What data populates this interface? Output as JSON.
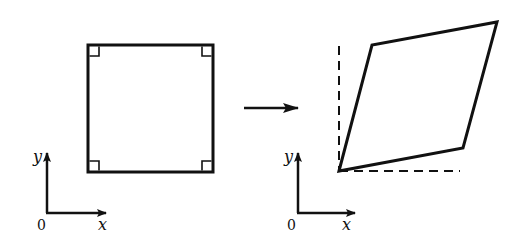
{
  "diagram": {
    "colors": {
      "stroke": "#111111",
      "background": "#ffffff"
    },
    "left_panel": {
      "shape": "square",
      "right_angle_markers": 4,
      "axes": {
        "origin_label": "0",
        "x_label": "x",
        "y_label": "y"
      }
    },
    "transition": {
      "icon": "right-arrow-icon"
    },
    "right_panel": {
      "shape": "parallelogram",
      "reference_lines": "dashed",
      "axes": {
        "origin_label": "0",
        "x_label": "x",
        "y_label": "y"
      }
    }
  }
}
